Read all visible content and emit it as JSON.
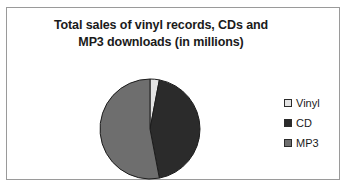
{
  "chart_data": {
    "type": "pie",
    "title": "Total sales of vinyl records, CDs and MP3 downloads (in millions)",
    "title_lines": [
      "Total sales of vinyl records, CDs and",
      "MP3 downloads (in millions)"
    ],
    "categories": [
      "Vinyl",
      "CD",
      "MP3"
    ],
    "values": [
      3,
      44,
      53
    ],
    "unit": "millions",
    "start_angle_deg": 0,
    "direction": "clockwise",
    "legend_position": "right",
    "grid": false,
    "xlabel": "",
    "ylabel": "",
    "slices": [
      {
        "label": "Vinyl",
        "value": 3,
        "percent": 3,
        "color": "#e3e3e3",
        "start_deg": 0,
        "end_deg": 10.8
      },
      {
        "label": "CD",
        "value": 44,
        "percent": 44,
        "color": "#2b2b2b",
        "start_deg": 10.8,
        "end_deg": 169.2
      },
      {
        "label": "MP3",
        "value": 53,
        "percent": 53,
        "color": "#6e6e6e",
        "start_deg": 169.2,
        "end_deg": 360
      }
    ]
  },
  "legend": {
    "items": [
      {
        "label": "Vinyl",
        "color": "#e3e3e3"
      },
      {
        "label": "CD",
        "color": "#2b2b2b"
      },
      {
        "label": "MP3",
        "color": "#6e6e6e"
      }
    ]
  },
  "colors": {
    "vinyl": "#e3e3e3",
    "cd": "#2b2b2b",
    "mp3": "#6e6e6e",
    "border": "#9a9a9a",
    "slice_outline": "#1c1c1c",
    "background": "#ffffff",
    "text": "#1a1a1a"
  }
}
